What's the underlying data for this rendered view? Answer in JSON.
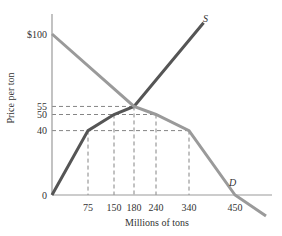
{
  "chart_data": {
    "type": "line",
    "title": "",
    "xlabel": "Millions of tons",
    "ylabel": "Price per ton",
    "xlim": [
      0,
      520
    ],
    "ylim": [
      0,
      110
    ],
    "x_ticks": [
      {
        "value": 75,
        "label": "75"
      },
      {
        "value": 150,
        "label": "150"
      },
      {
        "value": 180,
        "label": "180"
      },
      {
        "value": 240,
        "label": "240"
      },
      {
        "value": 340,
        "label": "340"
      },
      {
        "value": 450,
        "label": "450"
      }
    ],
    "y_ticks": [
      {
        "value": 0,
        "label": "0"
      },
      {
        "value": 40,
        "label": "40"
      },
      {
        "value": 50,
        "label": "50"
      },
      {
        "value": 55,
        "label": "55"
      },
      {
        "value": 100,
        "label": "$100"
      }
    ],
    "grid": false,
    "series": [
      {
        "name": "S",
        "label": "S",
        "points": [
          [
            0,
            0
          ],
          [
            75,
            40
          ],
          [
            150,
            50
          ],
          [
            180,
            55
          ],
          [
            375,
            107
          ]
        ]
      },
      {
        "name": "D",
        "label": "D",
        "points": [
          [
            0,
            100
          ],
          [
            180,
            55
          ],
          [
            240,
            50
          ],
          [
            340,
            40
          ],
          [
            450,
            0
          ],
          [
            520,
            -13
          ]
        ]
      }
    ],
    "reference_lines": [
      {
        "price": 55,
        "quantities": [
          180
        ]
      },
      {
        "price": 50,
        "quantities": [
          150,
          240
        ]
      },
      {
        "price": 40,
        "quantities": [
          75,
          340
        ]
      }
    ],
    "annotations": [
      {
        "text": "S",
        "near": "top end of supply curve"
      },
      {
        "text": "D",
        "near": "demand curve above 450"
      }
    ]
  }
}
